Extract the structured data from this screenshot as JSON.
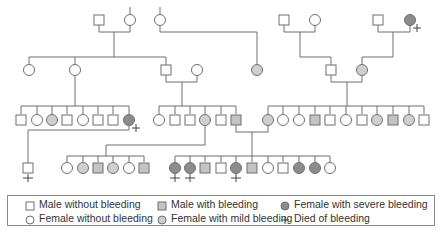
{
  "colors": {
    "line": "#6f6f6f",
    "unaffected": "#ffffff",
    "mild": "#cfcfcf",
    "male_bleeding": "#c4c4c4",
    "severe": "#8c8c8c"
  },
  "legend": [
    {
      "key": "male_none",
      "symbol": "square",
      "status": "none",
      "label": "Male without bleeding"
    },
    {
      "key": "female_none",
      "symbol": "circle",
      "status": "none",
      "label": "Female without bleeding"
    },
    {
      "key": "male_bleeding",
      "symbol": "square",
      "status": "bleeding",
      "label": "Male with bleeding"
    },
    {
      "key": "female_mild",
      "symbol": "circle",
      "status": "mild",
      "label": "Female with mild bleeding"
    },
    {
      "key": "female_severe",
      "symbol": "circle",
      "status": "severe",
      "label": "Female with severe bleeding"
    },
    {
      "key": "died",
      "symbol": "plus",
      "status": "died",
      "label": "Died of bleeding"
    }
  ],
  "pedigree": {
    "generations": [
      {
        "name": "I",
        "individuals": [
          {
            "id": "I-1",
            "sex": "M",
            "status": "none",
            "died": false
          },
          {
            "id": "I-2",
            "sex": "F",
            "status": "none",
            "died": false
          },
          {
            "id": "I-3",
            "sex": "F",
            "status": "none",
            "died": false
          },
          {
            "id": "I-4",
            "sex": "M",
            "status": "none",
            "died": false
          },
          {
            "id": "I-5",
            "sex": "F",
            "status": "none",
            "died": false
          },
          {
            "id": "I-6",
            "sex": "M",
            "status": "none",
            "died": false
          },
          {
            "id": "I-7",
            "sex": "F",
            "status": "severe",
            "died": true
          }
        ]
      },
      {
        "name": "II",
        "individuals": [
          {
            "id": "II-1",
            "sex": "F",
            "status": "none",
            "died": false
          },
          {
            "id": "II-2",
            "sex": "F",
            "status": "none",
            "died": false
          },
          {
            "id": "II-3",
            "sex": "M",
            "status": "none",
            "died": false
          },
          {
            "id": "II-4",
            "sex": "F",
            "status": "none",
            "died": false
          },
          {
            "id": "II-5",
            "sex": "F",
            "status": "mild",
            "died": false
          },
          {
            "id": "II-6",
            "sex": "M",
            "status": "none",
            "died": false
          },
          {
            "id": "II-7",
            "sex": "F",
            "status": "mild",
            "died": false
          }
        ]
      },
      {
        "name": "III",
        "sibships": [
          {
            "parents": "II-2",
            "children": [
              {
                "sex": "M",
                "status": "none",
                "died": false
              },
              {
                "sex": "F",
                "status": "none",
                "died": false
              },
              {
                "sex": "F",
                "status": "mild",
                "died": false
              },
              {
                "sex": "M",
                "status": "none",
                "died": false
              },
              {
                "sex": "F",
                "status": "none",
                "died": false
              },
              {
                "sex": "M",
                "status": "none",
                "died": false
              },
              {
                "sex": "M",
                "status": "none",
                "died": false
              },
              {
                "sex": "F",
                "status": "severe",
                "died": true
              }
            ]
          },
          {
            "parents": "II-3 x II-4",
            "children": [
              {
                "sex": "F",
                "status": "none",
                "died": false
              },
              {
                "sex": "M",
                "status": "none",
                "died": false
              },
              {
                "sex": "M",
                "status": "none",
                "died": false
              },
              {
                "sex": "F",
                "status": "mild",
                "died": false
              },
              {
                "sex": "M",
                "status": "none",
                "died": false
              },
              {
                "sex": "M",
                "status": "bleeding",
                "died": false
              }
            ]
          },
          {
            "parents": "II-6 x II-7",
            "children": [
              {
                "sex": "F",
                "status": "mild",
                "died": false
              },
              {
                "sex": "F",
                "status": "none",
                "died": false
              },
              {
                "sex": "F",
                "status": "none",
                "died": false
              },
              {
                "sex": "M",
                "status": "bleeding",
                "died": false
              },
              {
                "sex": "M",
                "status": "none",
                "died": false
              },
              {
                "sex": "F",
                "status": "none",
                "died": false
              },
              {
                "sex": "M",
                "status": "none",
                "died": false
              },
              {
                "sex": "F",
                "status": "mild",
                "died": false
              },
              {
                "sex": "M",
                "status": "bleeding",
                "died": false
              },
              {
                "sex": "F",
                "status": "mild",
                "died": false
              },
              {
                "sex": "M",
                "status": "none",
                "died": false
              }
            ]
          }
        ]
      },
      {
        "name": "IV",
        "sibships": [
          {
            "parents": "III-1-8",
            "children": [
              {
                "sex": "M",
                "status": "none",
                "died": true
              }
            ]
          },
          {
            "parents": "III-2-4",
            "children": [
              {
                "sex": "F",
                "status": "none",
                "died": false
              },
              {
                "sex": "F",
                "status": "mild",
                "died": false
              },
              {
                "sex": "M",
                "status": "bleeding",
                "died": false
              },
              {
                "sex": "F",
                "status": "mild",
                "died": false
              },
              {
                "sex": "F",
                "status": "none",
                "died": false
              },
              {
                "sex": "M",
                "status": "bleeding",
                "died": false
              }
            ]
          },
          {
            "parents": "III-2-6 x III-3-1",
            "children": [
              {
                "sex": "F",
                "status": "severe",
                "died": true
              },
              {
                "sex": "F",
                "status": "severe",
                "died": true
              },
              {
                "sex": "M",
                "status": "bleeding",
                "died": false
              },
              {
                "sex": "M",
                "status": "none",
                "died": false
              },
              {
                "sex": "F",
                "status": "severe",
                "died": true
              },
              {
                "sex": "M",
                "status": "bleeding",
                "died": false
              },
              {
                "sex": "F",
                "status": "none",
                "died": false
              },
              {
                "sex": "M",
                "status": "none",
                "died": false
              },
              {
                "sex": "F",
                "status": "severe",
                "died": false
              },
              {
                "sex": "F",
                "status": "severe",
                "died": false
              },
              {
                "sex": "F",
                "status": "none",
                "died": false
              }
            ]
          }
        ]
      }
    ]
  }
}
